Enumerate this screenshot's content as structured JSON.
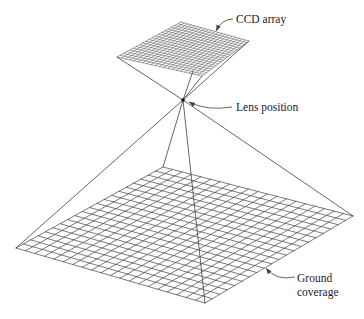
{
  "labels": {
    "ccd_array": {
      "text": "CCD array",
      "x": 236,
      "y": 23
    },
    "lens_position": {
      "text": "Lens position",
      "x": 236,
      "y": 111
    },
    "ground_line1": {
      "text": "Ground",
      "x": 297,
      "y": 282
    },
    "ground_line2": {
      "text": "coverage",
      "x": 297,
      "y": 296
    }
  },
  "colors": {
    "background": "#ffffff",
    "line": "#3f3f3f",
    "ccd_grid_line": "#4a4a4a",
    "ground_grid_line": "#4f4f4f",
    "text": "#1c1c1c",
    "lens_dot": "#111111"
  },
  "diagram": {
    "ccd_grid": {
      "divisions": 20,
      "stroke_width": 0.5,
      "corners": {
        "left": [
          117,
          57
        ],
        "top": [
          181,
          22
        ],
        "right": [
          249,
          41
        ],
        "bottom": [
          202,
          76
        ]
      }
    },
    "ground_grid": {
      "divisions": 20,
      "stroke_width": 0.75,
      "corners": {
        "left": [
          16,
          248
        ],
        "top": [
          163,
          167
        ],
        "right": [
          353,
          216
        ],
        "bottom": [
          205,
          303
        ]
      }
    },
    "lens": {
      "x": 183,
      "y": 100,
      "dot_radius": 1.8
    },
    "ray_stroke_width": 0.8,
    "rays": [
      {
        "name": "ccd-left-to-lens",
        "from": [
          117,
          57
        ],
        "to": [
          183,
          100
        ]
      },
      {
        "name": "ccd-right-to-lens",
        "from": [
          249,
          41
        ],
        "to": [
          183,
          100
        ]
      },
      {
        "name": "ccd-bottom-to-lens",
        "from": [
          202,
          76
        ],
        "to": [
          183,
          100
        ]
      },
      {
        "name": "ccd-hidden-ray-stub",
        "from": [
          193,
          71
        ],
        "to": [
          183,
          100
        ]
      },
      {
        "name": "lens-to-ground-left",
        "from": [
          183,
          100
        ],
        "to": [
          16,
          248
        ]
      },
      {
        "name": "lens-to-ground-top",
        "from": [
          183,
          100
        ],
        "to": [
          163,
          167
        ]
      },
      {
        "name": "lens-to-ground-right",
        "from": [
          183,
          100
        ],
        "to": [
          353,
          216
        ]
      },
      {
        "name": "lens-to-ground-bottom",
        "from": [
          183,
          100
        ],
        "to": [
          205,
          303
        ]
      }
    ],
    "leaders": [
      {
        "name": "ccd-array-leader",
        "start": [
          233,
          19
        ],
        "ctrl": [
          222,
          19
        ],
        "tip": [
          216,
          31
        ]
      },
      {
        "name": "lens-position-leader",
        "start": [
          232,
          107
        ],
        "ctrl": [
          206,
          111
        ],
        "tip": [
          189,
          102
        ]
      },
      {
        "name": "ground-coverage-leader",
        "start": [
          295,
          277
        ],
        "ctrl": [
          276,
          281
        ],
        "tip": [
          266,
          268
        ]
      }
    ],
    "arrowhead": {
      "length": 6,
      "half_width": 2.3
    }
  }
}
